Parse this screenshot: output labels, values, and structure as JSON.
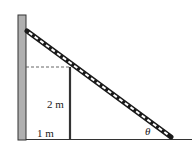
{
  "diagram": {
    "type": "physics-ladder-over-fence",
    "labels": {
      "height": "2 m",
      "distance": "1 m",
      "angle": "θ"
    },
    "colors": {
      "wall_fill": "#b0b0b0",
      "wall_stroke": "#333333",
      "ladder_dark": "#1a1a1a",
      "ladder_light": "#ffffff",
      "ground": "#333333",
      "dashed": "#555555"
    }
  }
}
